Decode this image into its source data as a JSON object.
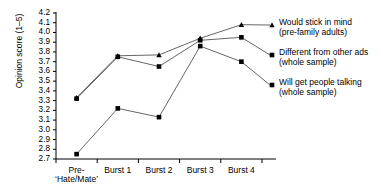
{
  "chart_data": {
    "type": "line",
    "title": "",
    "xlabel": "",
    "ylabel": "Opinion score (1–5)",
    "categories": [
      "Pre-‘Hate/Mate’",
      "Burst 1",
      "Burst 2",
      "Burst 3",
      "Burst 4"
    ],
    "category_lines": [
      [
        "Pre-",
        "‘Hate/Mate’"
      ],
      [
        "Burst 1"
      ],
      [
        "Burst 2"
      ],
      [
        "Burst 3"
      ],
      [
        "Burst 4"
      ]
    ],
    "ylim": [
      2.7,
      4.2
    ],
    "ytick_step": 0.1,
    "yticks": [
      "4.2",
      "4.1",
      "4.0",
      "3.9",
      "3.8",
      "3.7",
      "3.6",
      "3.5",
      "3.4",
      "3.3",
      "3.2",
      "3.1",
      "3.0",
      "2.9",
      "2.8",
      "2.7"
    ],
    "grid": false,
    "legend_position": "right-inline",
    "line_color": "#555555",
    "marker_color": "#000000",
    "axis_color": "#000000",
    "series": [
      {
        "name": "Would stick in mind (pre-family adults)",
        "label_lines": [
          "Would stick in mind",
          "(pre-family adults)"
        ],
        "marker": "triangle",
        "values": [
          3.33,
          3.76,
          3.77,
          3.94,
          4.08
        ]
      },
      {
        "name": "Different from other ads (whole sample)",
        "label_lines": [
          "Different from other ads",
          "(whole sample)"
        ],
        "marker": "square",
        "values": [
          3.32,
          3.75,
          3.65,
          3.92,
          3.95
        ]
      },
      {
        "name": "Will get people talking (whole sample)",
        "label_lines": [
          "Will get people talking",
          "(whole sample)"
        ],
        "marker": "square",
        "values": [
          2.75,
          3.22,
          3.13,
          3.86,
          3.7
        ]
      }
    ]
  }
}
